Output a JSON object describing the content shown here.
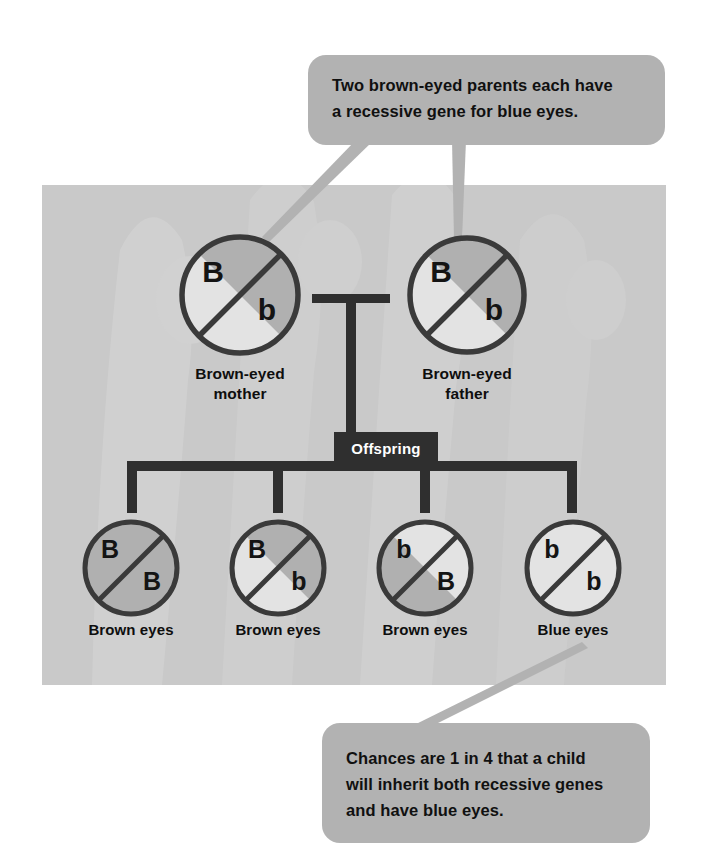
{
  "figure": {
    "panel_bg": "#c9c9c9",
    "callout_bg": "#b2b2b2",
    "shade_fill": "#b0b0b0",
    "light_fill": "#e3e3e3",
    "stroke": "#3a3a3a",
    "connector": "#2f2f2f"
  },
  "callouts": {
    "top": {
      "text": "Two brown-eyed parents each have\na recessive gene for blue eyes.",
      "points_to": [
        "brown-eyed mother",
        "brown-eyed father"
      ]
    },
    "bottom": {
      "text": "Chances are 1 in 4 that a child\nwill inherit both recessive genes\nand have blue eyes.",
      "points_to": [
        "blue eyes offspring"
      ]
    }
  },
  "connector": {
    "offspring_label": "Offspring"
  },
  "parents": [
    {
      "id": "mother",
      "label": "Brown-eyed\nmother",
      "upper_allele": "B",
      "lower_allele": "b",
      "upper_shaded": true,
      "lower_shaded": false,
      "cx": 240,
      "cy": 295,
      "r": 58
    },
    {
      "id": "father",
      "label": "Brown-eyed\nfather",
      "upper_allele": "B",
      "lower_allele": "b",
      "upper_shaded": true,
      "lower_shaded": false,
      "cx": 467,
      "cy": 295,
      "r": 57
    }
  ],
  "offspring": [
    {
      "id": "child-1",
      "label": "Brown eyes",
      "genotype": "BB",
      "upper_allele": "B",
      "lower_allele": "B",
      "upper_shaded": true,
      "lower_shaded": true,
      "cx": 131,
      "cy": 568,
      "r": 46
    },
    {
      "id": "child-2",
      "label": "Brown eyes",
      "genotype": "Bb",
      "upper_allele": "B",
      "lower_allele": "b",
      "upper_shaded": true,
      "lower_shaded": false,
      "cx": 278,
      "cy": 568,
      "r": 46
    },
    {
      "id": "child-3",
      "label": "Brown eyes",
      "genotype": "bB",
      "upper_allele": "b",
      "lower_allele": "B",
      "upper_shaded": false,
      "lower_shaded": true,
      "cx": 425,
      "cy": 568,
      "r": 46
    },
    {
      "id": "child-4",
      "label": "Blue eyes",
      "genotype": "bb",
      "upper_allele": "b",
      "lower_allele": "b",
      "upper_shaded": false,
      "lower_shaded": false,
      "cx": 573,
      "cy": 568,
      "r": 46
    }
  ]
}
